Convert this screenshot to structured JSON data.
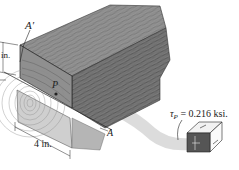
{
  "figure": {
    "labels": {
      "a_prime": "A′",
      "a": "A",
      "p": "P",
      "height_dim": "in.",
      "width_dim": "4 in.",
      "tau_symbol": "τ",
      "tau_subscript": "P",
      "tau_value": " = 0.216 ksi."
    },
    "colors": {
      "wood_top": "#8a8a8a",
      "wood_side": "#6e6e6e",
      "wood_end": "#bdbdbd",
      "grain": "#4a4a4a",
      "swoosh": "#d0d0d0",
      "element_edge": "#222222"
    }
  }
}
